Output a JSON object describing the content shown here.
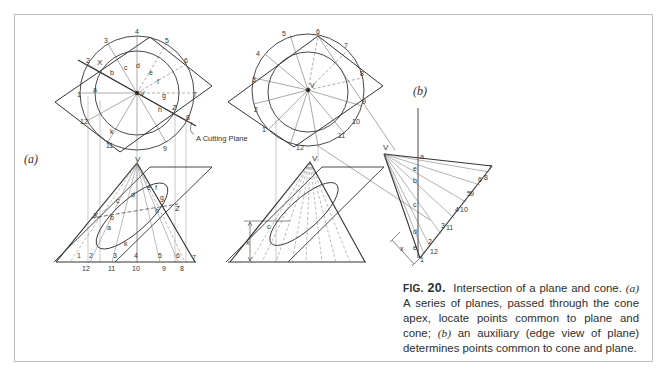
{
  "figure": {
    "number_prefix": "FIG.",
    "number": "20.",
    "caption_parts": {
      "title": "Intersection of a plane and cone.",
      "a_label": "(a)",
      "a_text": "A series of planes, passed through the cone apex, locate points common to plane and cone;",
      "b_label": "(b)",
      "b_text": "an auxiliary (edge view of plane) determines points common to cone and plane."
    },
    "subfigure_labels": {
      "a": "(a)",
      "b": "(b)"
    },
    "annotations": {
      "cutting_plane": "A Cutting Plane",
      "apex": "V",
      "x_point": "X",
      "z_point": "Z",
      "dimension_x": "x"
    },
    "top_view_a": {
      "outer_numbers": [
        "1",
        "2",
        "3",
        "4",
        "5",
        "6",
        "7",
        "8",
        "9",
        "10",
        "11",
        "12"
      ],
      "inner_letters": [
        "a",
        "b",
        "c",
        "d",
        "e",
        "f",
        "g",
        "h",
        "k"
      ]
    },
    "front_view_a": {
      "base_numbers_top": [
        "1",
        "2",
        "3",
        "4",
        "5",
        "6",
        "7"
      ],
      "base_numbers_bottom": [
        "12",
        "11",
        "10",
        "9",
        "8"
      ],
      "letters": [
        "a",
        "b",
        "c",
        "d",
        "e",
        "f",
        "g",
        "h",
        "k"
      ]
    },
    "auxiliary_view_b": {
      "numbers": [
        "1",
        "2",
        "3",
        "4",
        "5",
        "6",
        "7",
        "8",
        "9",
        "10",
        "11",
        "12"
      ],
      "letters": [
        "a",
        "b",
        "c",
        "d",
        "e"
      ]
    }
  }
}
